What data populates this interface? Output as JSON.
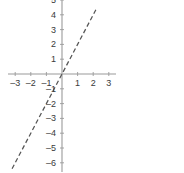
{
  "chart_data": {
    "type": "line",
    "title": "",
    "subtitle": "",
    "xlabel": "",
    "ylabel": "",
    "equation": "y = 2x",
    "slope": 2,
    "intercept": 0,
    "xlim": [
      -3.4,
      3.4
    ],
    "ylim": [
      -6.4,
      5.2
    ],
    "x": [
      -3.2,
      2.2
    ],
    "y": [
      -6.4,
      4.4
    ],
    "series": [
      {
        "name": "y = 2x",
        "style": "dashed",
        "color": "#555555",
        "points": [
          {
            "x": -3.2,
            "y": -6.4
          },
          {
            "x": -3,
            "y": -6
          },
          {
            "x": -2,
            "y": -4
          },
          {
            "x": -1,
            "y": -2
          },
          {
            "x": 0,
            "y": 0
          },
          {
            "x": 1,
            "y": 2
          },
          {
            "x": 2,
            "y": 4
          },
          {
            "x": 2.2,
            "y": 4.4
          }
        ]
      }
    ],
    "grid": false,
    "legend": "none",
    "axis_color": "#9a9a9a",
    "background": "#ffffff",
    "x_ticks": [
      {
        "value": -3,
        "label": "–3"
      },
      {
        "value": -2,
        "label": "–2"
      },
      {
        "value": -1,
        "label": "–1"
      },
      {
        "value": 1,
        "label": "1"
      },
      {
        "value": 2,
        "label": "2"
      },
      {
        "value": 3,
        "label": "3"
      }
    ],
    "y_ticks": [
      {
        "value": 5,
        "label": "5"
      },
      {
        "value": 4,
        "label": "4"
      },
      {
        "value": 3,
        "label": "3"
      },
      {
        "value": 2,
        "label": "2"
      },
      {
        "value": 1,
        "label": "1"
      },
      {
        "value": -1,
        "label": "–1"
      },
      {
        "value": -2,
        "label": "–2"
      },
      {
        "value": -3,
        "label": "–3"
      },
      {
        "value": -4,
        "label": "–4"
      },
      {
        "value": -5,
        "label": "–5"
      },
      {
        "value": -6,
        "label": "–6"
      }
    ]
  },
  "geometry": {
    "origin_x": 62,
    "origin_y": 74,
    "unit_x": 15.6,
    "unit_y": 14.8,
    "x_axis_left": 8,
    "x_axis_right": 116,
    "y_axis_top": 0,
    "y_axis_bottom": 172
  }
}
